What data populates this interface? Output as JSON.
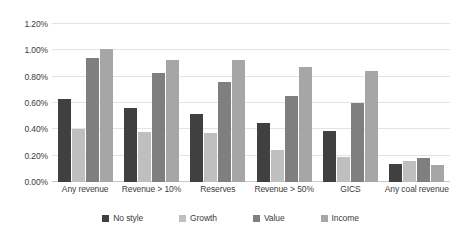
{
  "chart_data": {
    "type": "bar",
    "title": "",
    "xlabel": "",
    "ylabel": "",
    "ylim": [
      0,
      1.2
    ],
    "ytick_labels": [
      "1.20%",
      "1.00%",
      "0.80%",
      "0.60%",
      "0.40%",
      "0.20%",
      "0.00%"
    ],
    "ytick_values": [
      1.2,
      1.0,
      0.8,
      0.6,
      0.4,
      0.2,
      0.0
    ],
    "grid": true,
    "legend_position": "bottom",
    "value_suffix": "%",
    "categories": [
      "Any revenue",
      "Revenue > 10%",
      "Reserves",
      "Revenue > 50%",
      "GICS",
      "Any coal revenue"
    ],
    "series": [
      {
        "name": "No style",
        "color": "#404040",
        "values": [
          0.63,
          0.56,
          0.52,
          0.45,
          0.39,
          0.14
        ]
      },
      {
        "name": "Growth",
        "color": "#bfbfbf",
        "values": [
          0.4,
          0.38,
          0.37,
          0.24,
          0.19,
          0.16
        ]
      },
      {
        "name": "Value",
        "color": "#7f7f7f",
        "values": [
          0.94,
          0.83,
          0.76,
          0.65,
          0.6,
          0.18
        ]
      },
      {
        "name": "Income",
        "color": "#a6a6a6",
        "values": [
          1.01,
          0.93,
          0.93,
          0.87,
          0.84,
          0.13
        ]
      }
    ]
  },
  "caption": {
    "text": ""
  }
}
